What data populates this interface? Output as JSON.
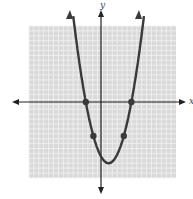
{
  "chart_data": {
    "type": "line",
    "title": "",
    "xlabel": "x",
    "ylabel": "y",
    "grid": true,
    "xlim": [
      -10,
      10
    ],
    "ylim": [
      -11,
      11
    ],
    "series": [
      {
        "name": "parabola",
        "function": "y = x^2 - 2x - 8",
        "x": [
          -4,
          -3,
          -2,
          -1,
          0,
          1,
          2,
          3,
          4,
          5,
          6
        ],
        "values": [
          16,
          7,
          0,
          -5,
          -8,
          -9,
          -8,
          -5,
          0,
          7,
          16
        ]
      }
    ],
    "marked_points": [
      {
        "x": -2,
        "y": 0
      },
      {
        "x": 4,
        "y": 0
      },
      {
        "x": -1,
        "y": -5
      },
      {
        "x": 3,
        "y": -5
      }
    ],
    "vertex": {
      "x": 1,
      "y": -9
    },
    "colors": {
      "curve": "#3a3a3a",
      "grid_bg": "#d9d9d9",
      "grid_line": "#f2f2f2",
      "axis": "#222222"
    }
  },
  "labels": {
    "y_axis": "y",
    "x_axis": "x"
  }
}
